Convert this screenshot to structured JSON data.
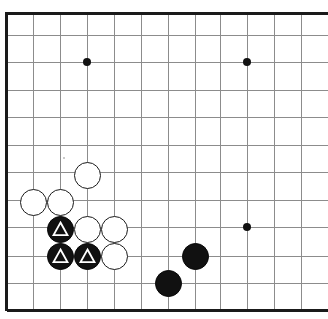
{
  "figure": {
    "kind": "go-board-diagram",
    "title": "",
    "width_px": 328,
    "height_px": 319,
    "background_color": "#ffffff",
    "cropped_edges": [
      "right"
    ]
  },
  "board": {
    "line_color": "#8c8c8c",
    "border_color": "#1a1a1a",
    "border_width_px": 3,
    "line_width_px": 1,
    "cell_size_px": 27.3,
    "origin_x_px": 6.5,
    "origin_y_px": 13,
    "columns": 12,
    "rows": 12,
    "vertical_line_x": [
      6.5,
      33,
      60,
      87,
      114,
      141,
      168,
      195,
      220.5,
      247,
      274,
      301
    ],
    "horizontal_line_y": [
      13,
      35,
      62,
      90,
      117,
      145,
      172,
      200,
      227,
      256,
      283,
      310
    ],
    "edge_lines": {
      "left": true,
      "top": true,
      "bottom": true,
      "right": false
    }
  },
  "star_points": {
    "color": "#111111",
    "radius_px": 4,
    "points": [
      {
        "x": 87,
        "y": 62,
        "label": "upper-left-hoshi"
      },
      {
        "x": 247,
        "y": 62,
        "label": "upper-right-hoshi"
      },
      {
        "x": 247,
        "y": 227,
        "label": "lower-right-hoshi"
      }
    ]
  },
  "stones": {
    "radius_px": 13.5,
    "white_color": "#ffffff",
    "black_color": "#111111",
    "outline_color": "#1a1a1a",
    "marker_symbol": "triangle",
    "marker_color": "#ffffff",
    "items": [
      {
        "id": "w1",
        "color": "white",
        "x": 87,
        "y": 175,
        "marker": "none"
      },
      {
        "id": "w2",
        "color": "white",
        "x": 33,
        "y": 202,
        "marker": "none"
      },
      {
        "id": "w3",
        "color": "white",
        "x": 60,
        "y": 202,
        "marker": "none"
      },
      {
        "id": "w4",
        "color": "white",
        "x": 87,
        "y": 229,
        "marker": "none"
      },
      {
        "id": "w5",
        "color": "white",
        "x": 114,
        "y": 229,
        "marker": "none"
      },
      {
        "id": "w6",
        "color": "white",
        "x": 114,
        "y": 256,
        "marker": "none"
      },
      {
        "id": "b1",
        "color": "black",
        "x": 60,
        "y": 229,
        "marker": "triangle"
      },
      {
        "id": "b2",
        "color": "black",
        "x": 60,
        "y": 256,
        "marker": "triangle"
      },
      {
        "id": "b3",
        "color": "black",
        "x": 87,
        "y": 256,
        "marker": "triangle"
      },
      {
        "id": "b4",
        "color": "black",
        "x": 195,
        "y": 256,
        "marker": "none"
      },
      {
        "id": "b5",
        "color": "black",
        "x": 168,
        "y": 283,
        "marker": "none"
      }
    ]
  },
  "speck": {
    "x": 64,
    "y": 158,
    "color": "#b9b9b9",
    "size_px": 2
  }
}
